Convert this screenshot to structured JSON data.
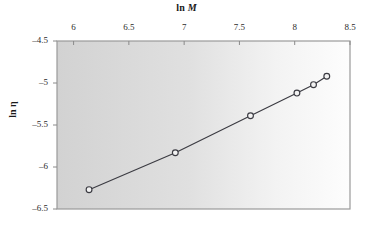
{
  "chart_data": {
    "type": "line",
    "title": "",
    "xlabel": "ln M",
    "ylabel": "ln η",
    "xlabel_prefix": "ln ",
    "xlabel_var": "M",
    "ylabel_prefix": "ln ",
    "ylabel_var": "η",
    "xlim": [
      5.85,
      8.5
    ],
    "ylim": [
      -6.5,
      -4.5
    ],
    "xticks": [
      6,
      6.5,
      7,
      7.5,
      8,
      8.5
    ],
    "xtick_labels": [
      "6",
      "6.5",
      "7",
      "7.5",
      "8",
      "8.5"
    ],
    "yticks": [
      -4.5,
      -5,
      -5.5,
      -6,
      -6.5
    ],
    "ytick_labels": [
      "–4.5",
      "–5",
      "–5.5",
      "–6",
      "–6.5"
    ],
    "x_axis_position": "top",
    "y_axis_position": "left",
    "grid": false,
    "legend": null,
    "marker": "open-circle",
    "series": [
      {
        "name": "ln η vs ln M",
        "x": [
          6.14,
          6.92,
          7.6,
          8.02,
          8.17,
          8.29
        ],
        "y": [
          -6.27,
          -5.83,
          -5.39,
          -5.12,
          -5.02,
          -4.92
        ]
      }
    ],
    "colors": {
      "line": "#3b3b42",
      "marker_edge": "#3b3b42",
      "marker_face": "#f2f2f2",
      "axis": "#8a8a8a",
      "text": "#1a1a1a",
      "plot_bg_left": "#d4d4d4",
      "plot_bg_right": "#fcfcfc",
      "page_bg": "#ffffff"
    }
  },
  "figure": {
    "plot_area": {
      "left": 57,
      "top": 41,
      "right": 350,
      "bottom": 209
    }
  }
}
